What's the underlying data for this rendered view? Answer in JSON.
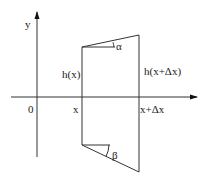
{
  "diagram": {
    "axes": {
      "x_label": "x",
      "y_label": "y",
      "origin_label": "0"
    },
    "labels": {
      "x_left": "x",
      "x_right": "x+Δx",
      "h_left": "h(x)",
      "h_right": "h(x+Δx)",
      "angle_top": "α",
      "angle_bottom": "β"
    },
    "colors": {
      "stroke": "#333333",
      "text": "#222222",
      "background": "#ffffff"
    }
  }
}
